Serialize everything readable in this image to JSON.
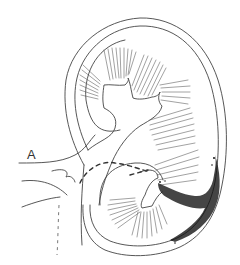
{
  "figure": {
    "labels": [
      {
        "id": "A",
        "text": "A"
      }
    ],
    "colors": {
      "line": "#444444",
      "stipple": "#111111",
      "background": "#ffffff"
    }
  }
}
